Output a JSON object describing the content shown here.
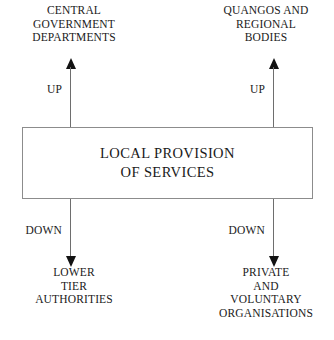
{
  "diagram": {
    "type": "flow-diagram",
    "center": {
      "label_lines": [
        "LOCAL PROVISION",
        "OF SERVICES"
      ]
    },
    "top_nodes": [
      {
        "id": "central-government-departments",
        "label_lines": [
          "CENTRAL",
          "GOVERNMENT",
          "DEPARTMENTS"
        ]
      },
      {
        "id": "quangos-and-regional-bodies",
        "label_lines": [
          "QUANGOS AND",
          "REGIONAL",
          "BODIES"
        ]
      }
    ],
    "bottom_nodes": [
      {
        "id": "lower-tier-authorities",
        "label_lines": [
          "LOWER",
          "TIER",
          "AUTHORITIES"
        ]
      },
      {
        "id": "private-and-voluntary-organisations",
        "label_lines": [
          "PRIVATE",
          "AND",
          "VOLUNTARY",
          "ORGANISATIONS"
        ]
      }
    ],
    "arrows": [
      {
        "id": "up-left",
        "direction": "up",
        "label": "UP"
      },
      {
        "id": "up-right",
        "direction": "up",
        "label": "UP"
      },
      {
        "id": "down-left",
        "direction": "down",
        "label": "DOWN"
      },
      {
        "id": "down-right",
        "direction": "down",
        "label": "DOWN"
      }
    ],
    "colors": {
      "background": "#ffffff",
      "text": "#1a1a1a",
      "box_border": "#8c8c8c",
      "arrow_shaft": "#6e6e6e",
      "arrow_head": "#121212"
    }
  }
}
